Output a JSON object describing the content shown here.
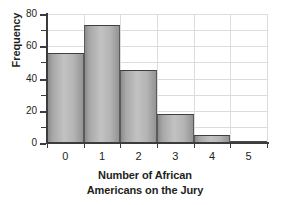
{
  "chart_data": {
    "type": "bar",
    "title": "",
    "categories": [
      "0",
      "1",
      "2",
      "3",
      "4",
      "5"
    ],
    "values": [
      56,
      73,
      45,
      18,
      5,
      1
    ],
    "xlabel_lines": [
      "Number of African",
      "Americans on the Jury"
    ],
    "xlabel": "Number of African Americans on the Jury",
    "ylabel": "Frequency",
    "ylim": [
      0,
      80
    ],
    "ytick_labels": [
      "0",
      "20",
      "40",
      "60",
      "80"
    ],
    "ytick_values": [
      0,
      20,
      40,
      60,
      80
    ],
    "yminor_values": [
      10,
      30,
      50,
      70
    ],
    "grid": true,
    "legend": "none",
    "bar_fill_light": "#c2c2c2",
    "bar_fill_dark": "#8c8c8c",
    "bar_edge_color": "#3f3f3f",
    "grid_color": "#dcdcdc",
    "axis_color": "#3c3c3c",
    "text_color": "#231f20",
    "background": "#ffffff"
  }
}
